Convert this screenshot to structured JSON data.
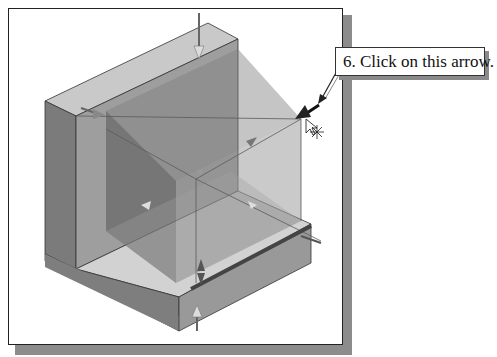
{
  "callout": {
    "text": "6. Click on this arrow."
  },
  "viewport": {
    "content": "isometric-3d-model-with-transparent-preview",
    "target_arrow": "dynamic-extrude-drag-arrow"
  },
  "colors": {
    "frame_border": "#222222",
    "frame_shadow": "#8c8c8c",
    "solid_top": "#c4c4c4",
    "solid_left": "#7a7a7a",
    "solid_right": "#9a9a9a",
    "preview_fill": "#8f8f8f"
  },
  "cursor": {
    "icon": "arrow-cursor-with-star"
  }
}
